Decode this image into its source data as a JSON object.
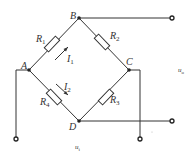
{
  "diagram": {
    "type": "wheatstone-bridge",
    "nodes": {
      "A": {
        "label": "A"
      },
      "B": {
        "label": "B"
      },
      "C": {
        "label": "C"
      },
      "D": {
        "label": "D"
      }
    },
    "resistors": [
      {
        "id": "R1",
        "label": "R",
        "sub": "1",
        "between": [
          "A",
          "B"
        ]
      },
      {
        "id": "R2",
        "label": "R",
        "sub": "2",
        "between": [
          "B",
          "C"
        ]
      },
      {
        "id": "R3",
        "label": "R",
        "sub": "3",
        "between": [
          "C",
          "D"
        ]
      },
      {
        "id": "R4",
        "label": "R",
        "sub": "4",
        "between": [
          "A",
          "D"
        ]
      }
    ],
    "currents": [
      {
        "id": "I1",
        "label": "I",
        "sub": "1",
        "branch": "A-B"
      },
      {
        "id": "I2",
        "label": "I",
        "sub": "2",
        "branch": "A-D"
      }
    ],
    "voltages": {
      "output": {
        "label": "u",
        "sub": "o"
      },
      "input": {
        "label": "u",
        "sub": "i"
      }
    }
  }
}
